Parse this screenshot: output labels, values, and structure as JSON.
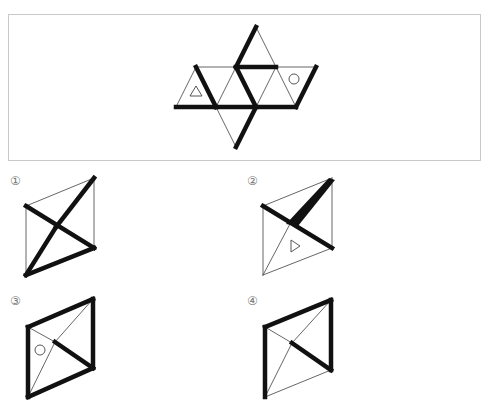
{
  "question": {
    "net": {
      "description": "Octahedron net: 8 equilateral triangles with thick-edge markings, a small triangle symbol and a circle symbol",
      "thin_color": "#555555",
      "thick_color": "#111111",
      "thin_width": 0.9,
      "thick_width": 4.5,
      "thin_edges": [
        [
          [
            196,
            67
          ],
          [
            176,
            107
          ]
        ],
        [
          [
            196,
            67
          ],
          [
            236,
            67
          ]
        ],
        [
          [
            216,
            107
          ],
          [
            236,
            67
          ]
        ],
        [
          [
            276,
            67
          ],
          [
            256,
            107
          ]
        ],
        [
          [
            276,
            67
          ],
          [
            296,
            107
          ]
        ],
        [
          [
            276,
            67
          ],
          [
            316,
            67
          ]
        ],
        [
          [
            256,
            27
          ],
          [
            276,
            67
          ]
        ],
        [
          [
            216,
            107
          ],
          [
            236,
            147
          ]
        ]
      ],
      "thick_edges": [
        [
          [
            256,
            27
          ],
          [
            236,
            67
          ]
        ],
        [
          [
            236,
            67
          ],
          [
            276,
            67
          ]
        ],
        [
          [
            196,
            67
          ],
          [
            216,
            107
          ]
        ],
        [
          [
            176,
            107
          ],
          [
            216,
            107
          ]
        ],
        [
          [
            216,
            107
          ],
          [
            256,
            107
          ]
        ],
        [
          [
            236,
            67
          ],
          [
            256,
            107
          ]
        ],
        [
          [
            256,
            107
          ],
          [
            296,
            107
          ]
        ],
        [
          [
            316,
            67
          ],
          [
            296,
            107
          ]
        ],
        [
          [
            256,
            107
          ],
          [
            236,
            147
          ]
        ]
      ],
      "symbols": [
        {
          "type": "triangle",
          "points": [
            [
              196,
              86
            ],
            [
              190,
              96
            ],
            [
              202,
              96
            ]
          ]
        },
        {
          "type": "circle",
          "cx": 294,
          "cy": 79,
          "r": 5
        }
      ]
    }
  },
  "options": [
    {
      "label": "①",
      "label_pos": [
        10,
        175
      ],
      "vertices": {
        "TR": [
          94,
          178
        ],
        "TL": [
          26,
          206
        ],
        "BL": [
          26,
          275
        ],
        "BR": [
          94,
          248
        ]
      },
      "cross": [
        56,
        227
      ],
      "thin_edges": [
        [
          "TL",
          "TR"
        ],
        [
          "TL",
          "BL"
        ],
        [
          "TR",
          "BR"
        ]
      ],
      "thick_edges": [
        [
          "TL",
          "BR"
        ],
        [
          "TR",
          "cross"
        ],
        [
          "cross",
          "BL"
        ],
        [
          "BL",
          "BR"
        ]
      ],
      "wedge": null,
      "symbols": []
    },
    {
      "label": "②",
      "label_pos": [
        247,
        175
      ],
      "vertices": {
        "TR": [
          332,
          178
        ],
        "TL": [
          263,
          206
        ],
        "BL": [
          263,
          275
        ],
        "BR": [
          332,
          248
        ]
      },
      "cross": [
        290,
        224
      ],
      "thin_edges": [
        [
          "TL",
          "TR"
        ],
        [
          "TL",
          "BL"
        ],
        [
          "TR",
          "BR"
        ],
        [
          "BL",
          "BR"
        ],
        [
          "cross",
          "BL"
        ]
      ],
      "thick_edges": [
        [
          "TL",
          "BR"
        ]
      ],
      "wedge": {
        "points": [
          [
            329,
            178
          ],
          [
            335,
            180
          ],
          [
            298,
            226
          ],
          [
            286,
            224
          ]
        ]
      },
      "symbols": [
        {
          "type": "triangle",
          "points": [
            [
              291,
              240
            ],
            [
              291,
              252
            ],
            [
              300,
              246
            ]
          ]
        }
      ]
    },
    {
      "label": "③",
      "label_pos": [
        10,
        295
      ],
      "vertices": {
        "TR": [
          93,
          299
        ],
        "TL": [
          28,
          327
        ],
        "BL": [
          28,
          397
        ],
        "BR": [
          93,
          368
        ]
      },
      "cross": [
        55,
        342
      ],
      "thin_edges": [
        [
          "TL",
          "cross"
        ],
        [
          "cross",
          "TR"
        ],
        [
          "cross",
          "BL"
        ]
      ],
      "thick_edges": [
        [
          "TL",
          "TR"
        ],
        [
          "TL",
          "BL"
        ],
        [
          "TR",
          "BR"
        ],
        [
          "BL",
          "BR"
        ],
        [
          "cross",
          "BR"
        ]
      ],
      "wedge": null,
      "symbols": [
        {
          "type": "circle",
          "cx": 40,
          "cy": 350,
          "r": 5
        }
      ]
    },
    {
      "label": "④",
      "label_pos": [
        247,
        295
      ],
      "vertices": {
        "TR": [
          331,
          300
        ],
        "TL": [
          265,
          327
        ],
        "BL": [
          265,
          397
        ],
        "BR": [
          331,
          370
        ]
      },
      "cross": [
        292,
        343
      ],
      "thin_edges": [
        [
          "BL",
          "BR"
        ],
        [
          "TL",
          "cross"
        ],
        [
          "cross",
          "TR"
        ],
        [
          "cross",
          "BL"
        ]
      ],
      "thick_edges": [
        [
          "TL",
          "TR"
        ],
        [
          "TL",
          "BL"
        ],
        [
          "TR",
          "BR"
        ],
        [
          "cross",
          "BR"
        ]
      ],
      "wedge": null,
      "symbols": []
    }
  ]
}
